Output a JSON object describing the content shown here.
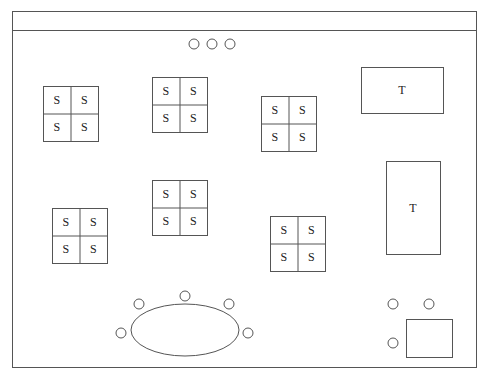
{
  "frame": {
    "x": 12,
    "y": 11,
    "w": 464,
    "h": 356,
    "header_y": 30
  },
  "top_circles": [
    {
      "cx": 194,
      "cy": 44
    },
    {
      "cx": 212,
      "cy": 44
    },
    {
      "cx": 230,
      "cy": 44
    }
  ],
  "seat_groups": [
    {
      "x": 43,
      "y": 86,
      "size": 55,
      "labels": [
        "S",
        "S",
        "S",
        "S"
      ]
    },
    {
      "x": 152,
      "y": 77,
      "size": 55,
      "labels": [
        "S",
        "S",
        "S",
        "S"
      ]
    },
    {
      "x": 261,
      "y": 96,
      "size": 55,
      "labels": [
        "S",
        "S",
        "S",
        "S"
      ]
    },
    {
      "x": 152,
      "y": 180,
      "size": 55,
      "labels": [
        "S",
        "S",
        "S",
        "S"
      ]
    },
    {
      "x": 52,
      "y": 208,
      "size": 55,
      "labels": [
        "S",
        "S",
        "S",
        "S"
      ]
    },
    {
      "x": 270,
      "y": 216,
      "size": 55,
      "labels": [
        "S",
        "S",
        "S",
        "S"
      ]
    }
  ],
  "tables": [
    {
      "x": 361,
      "y": 67,
      "w": 82,
      "h": 46,
      "label": "T"
    },
    {
      "x": 386,
      "y": 161,
      "w": 54,
      "h": 93,
      "label": "T"
    }
  ],
  "oval_table": {
    "cx": 185,
    "cy": 330,
    "rx": 54,
    "ry": 26
  },
  "oval_chairs": [
    {
      "cx": 121,
      "cy": 333
    },
    {
      "cx": 139,
      "cy": 304
    },
    {
      "cx": 185,
      "cy": 296
    },
    {
      "cx": 229,
      "cy": 304
    },
    {
      "cx": 248,
      "cy": 333
    }
  ],
  "desk": {
    "x": 406,
    "y": 319,
    "w": 46,
    "h": 38
  },
  "desk_chairs": [
    {
      "cx": 393,
      "cy": 304
    },
    {
      "cx": 429,
      "cy": 304
    },
    {
      "cx": 393,
      "cy": 343
    }
  ],
  "chair_radius": 5
}
